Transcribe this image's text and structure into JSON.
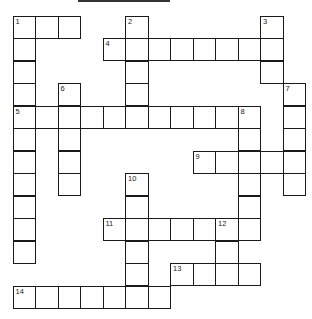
{
  "puzzle": {
    "type": "crossword",
    "cell_size_px": 22.5,
    "origin": {
      "x": 13,
      "y": 16
    },
    "entries": [
      {
        "number": 1,
        "direction": "across",
        "row": 0,
        "col": 0,
        "length": 3
      },
      {
        "number": 1,
        "direction": "down",
        "row": 0,
        "col": 0,
        "length": 11
      },
      {
        "number": 2,
        "direction": "down",
        "row": 0,
        "col": 5,
        "length": 5
      },
      {
        "number": 3,
        "direction": "down",
        "row": 0,
        "col": 11,
        "length": 3
      },
      {
        "number": 4,
        "direction": "across",
        "row": 1,
        "col": 4,
        "length": 8
      },
      {
        "number": 5,
        "direction": "across",
        "row": 4,
        "col": 0,
        "length": 11
      },
      {
        "number": 6,
        "direction": "down",
        "row": 3,
        "col": 2,
        "length": 5
      },
      {
        "number": 7,
        "direction": "down",
        "row": 3,
        "col": 12,
        "length": 5
      },
      {
        "number": 8,
        "direction": "down",
        "row": 4,
        "col": 10,
        "length": 6
      },
      {
        "number": 9,
        "direction": "across",
        "row": 6,
        "col": 8,
        "length": 5
      },
      {
        "number": 10,
        "direction": "down",
        "row": 7,
        "col": 5,
        "length": 6
      },
      {
        "number": 11,
        "direction": "across",
        "row": 9,
        "col": 4,
        "length": 7
      },
      {
        "number": 12,
        "direction": "down",
        "row": 9,
        "col": 9,
        "length": 3
      },
      {
        "number": 13,
        "direction": "across",
        "row": 11,
        "col": 7,
        "length": 4
      },
      {
        "number": 14,
        "direction": "across",
        "row": 12,
        "col": 0,
        "length": 7
      }
    ]
  }
}
